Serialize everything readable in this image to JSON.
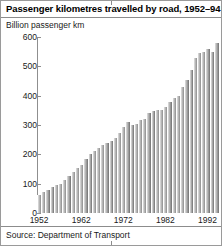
{
  "figure": {
    "title": "Passenger kilometres travelled by road, 1952–94",
    "subtitle": "Billion passenger km",
    "source": "Source: Department of Transport"
  },
  "chart_data": {
    "type": "bar",
    "title": "Passenger kilometres travelled by road, 1952–94",
    "subtitle": "Billion passenger km",
    "xlabel": "",
    "ylabel": "Billion passenger km",
    "ylim": [
      0,
      600
    ],
    "yticks": [
      0,
      100,
      200,
      300,
      400,
      500,
      600
    ],
    "ytick_labels": [
      "0",
      "100",
      "200",
      "300",
      "400",
      "500",
      "600"
    ],
    "xtick_labels": [
      "1952",
      "1962",
      "1972",
      "1982",
      "1992"
    ],
    "xticks_categories": [
      "1952",
      "1962",
      "1972",
      "1982",
      "1992"
    ],
    "grid": false,
    "legend": null,
    "bar_style": "horizontal-gradient-grey",
    "source": "Source: Department of Transport",
    "categories": [
      "1952",
      "1953",
      "1954",
      "1955",
      "1956",
      "1957",
      "1958",
      "1959",
      "1960",
      "1961",
      "1962",
      "1963",
      "1964",
      "1965",
      "1966",
      "1967",
      "1968",
      "1969",
      "1970",
      "1971",
      "1972",
      "1973",
      "1974",
      "1975",
      "1976",
      "1977",
      "1978",
      "1979",
      "1980",
      "1981",
      "1982",
      "1983",
      "1984",
      "1985",
      "1986",
      "1987",
      "1988",
      "1989",
      "1990",
      "1991",
      "1992",
      "1993",
      "1994"
    ],
    "values": [
      62,
      70,
      78,
      88,
      95,
      100,
      112,
      126,
      140,
      152,
      165,
      183,
      200,
      210,
      220,
      232,
      240,
      245,
      255,
      272,
      292,
      310,
      300,
      305,
      318,
      322,
      340,
      348,
      350,
      352,
      362,
      378,
      392,
      400,
      428,
      452,
      488,
      528,
      545,
      548,
      560,
      548,
      580
    ]
  }
}
